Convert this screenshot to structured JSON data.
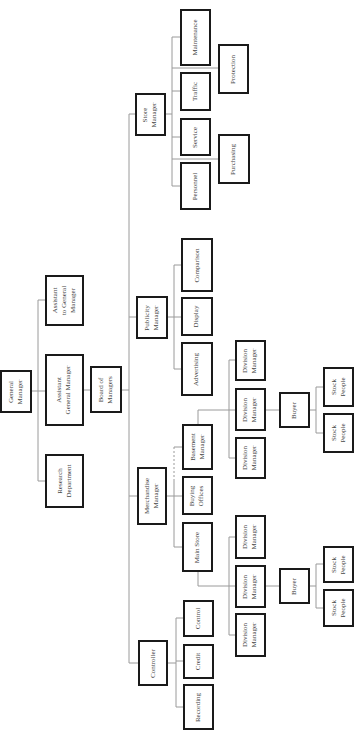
{
  "diagram": {
    "type": "organization-chart",
    "orientation": "rotated-90-ccw",
    "colors": {
      "box_border": "#1a1a1a",
      "connector": "#9a9a9a",
      "text": "#444444",
      "background": "#ffffff"
    },
    "nodes": [
      {
        "id": "gm",
        "label": "General\nManager",
        "x": 0,
        "y": 370,
        "w": 32,
        "h": 43
      },
      {
        "id": "asst_to_gm",
        "label": "Assistant\nto General\nManager",
        "x": 45,
        "y": 275,
        "w": 39,
        "h": 51
      },
      {
        "id": "asst_gm",
        "label": "Assistant\nGeneral Manager",
        "x": 45,
        "y": 354,
        "w": 39,
        "h": 72
      },
      {
        "id": "research",
        "label": "Research\nDepartment",
        "x": 45,
        "y": 454,
        "w": 39,
        "h": 54
      },
      {
        "id": "board",
        "label": "Board of\nManagers",
        "x": 90,
        "y": 366,
        "w": 32,
        "h": 47
      },
      {
        "id": "store_mgr",
        "label": "Store\nManager",
        "x": 135,
        "y": 93,
        "w": 31,
        "h": 43
      },
      {
        "id": "maintenance",
        "label": "Maintenance",
        "x": 180,
        "y": 9,
        "w": 31,
        "h": 57
      },
      {
        "id": "traffic",
        "label": "Traffic",
        "x": 180,
        "y": 72,
        "w": 31,
        "h": 39
      },
      {
        "id": "service",
        "label": "Service",
        "x": 180,
        "y": 118,
        "w": 31,
        "h": 38
      },
      {
        "id": "personnel",
        "label": "Personnel",
        "x": 180,
        "y": 162,
        "w": 31,
        "h": 48
      },
      {
        "id": "protection",
        "label": "Protection",
        "x": 218,
        "y": 44,
        "w": 31,
        "h": 50
      },
      {
        "id": "purchasing",
        "label": "Purchasing",
        "x": 218,
        "y": 134,
        "w": 32,
        "h": 50
      },
      {
        "id": "publicity_mgr",
        "label": "Publicity\nManager",
        "x": 136,
        "y": 296,
        "w": 32,
        "h": 43
      },
      {
        "id": "comparison",
        "label": "Comparison",
        "x": 181,
        "y": 238,
        "w": 32,
        "h": 54
      },
      {
        "id": "display",
        "label": "Display",
        "x": 181,
        "y": 297,
        "w": 32,
        "h": 39
      },
      {
        "id": "advertising",
        "label": "Advertising",
        "x": 181,
        "y": 342,
        "w": 32,
        "h": 54
      },
      {
        "id": "merch_mgr",
        "label": "Merchandise\nManager",
        "x": 137,
        "y": 467,
        "w": 30,
        "h": 58
      },
      {
        "id": "basement_mgr",
        "label": "Basement\nManager",
        "x": 182,
        "y": 424,
        "w": 31,
        "h": 46
      },
      {
        "id": "buying_offices",
        "label": "Buying\nOffices",
        "x": 182,
        "y": 476,
        "w": 31,
        "h": 39
      },
      {
        "id": "main_store",
        "label": "Main Store",
        "x": 182,
        "y": 522,
        "w": 31,
        "h": 50
      },
      {
        "id": "b_div1",
        "label": "Division\nManager",
        "x": 235,
        "y": 340,
        "w": 31,
        "h": 41
      },
      {
        "id": "b_div2",
        "label": "Division\nManager",
        "x": 235,
        "y": 388,
        "w": 31,
        "h": 43
      },
      {
        "id": "b_div3",
        "label": "Division\nManager",
        "x": 235,
        "y": 437,
        "w": 31,
        "h": 42
      },
      {
        "id": "b_buyer",
        "label": "Buyer",
        "x": 279,
        "y": 392,
        "w": 31,
        "h": 36
      },
      {
        "id": "b_stock1",
        "label": "Stock\nPeople",
        "x": 323,
        "y": 367,
        "w": 31,
        "h": 40
      },
      {
        "id": "b_stock2",
        "label": "Stock\nPeople",
        "x": 323,
        "y": 413,
        "w": 31,
        "h": 40
      },
      {
        "id": "m_div1",
        "label": "Division\nManager",
        "x": 235,
        "y": 515,
        "w": 31,
        "h": 44
      },
      {
        "id": "m_div2",
        "label": "Division\nManager",
        "x": 235,
        "y": 565,
        "w": 31,
        "h": 43
      },
      {
        "id": "m_div3",
        "label": "Division\nManager",
        "x": 235,
        "y": 613,
        "w": 31,
        "h": 44
      },
      {
        "id": "m_buyer",
        "label": "Buyer",
        "x": 279,
        "y": 568,
        "w": 31,
        "h": 36
      },
      {
        "id": "m_stock1",
        "label": "Stock\nPeople",
        "x": 323,
        "y": 546,
        "w": 31,
        "h": 37
      },
      {
        "id": "m_stock2",
        "label": "Stock\nPeople",
        "x": 323,
        "y": 589,
        "w": 31,
        "h": 38
      },
      {
        "id": "controller",
        "label": "Controller",
        "x": 138,
        "y": 640,
        "w": 30,
        "h": 46
      },
      {
        "id": "control",
        "label": "Control",
        "x": 183,
        "y": 600,
        "w": 31,
        "h": 37
      },
      {
        "id": "credit",
        "label": "Credit",
        "x": 183,
        "y": 644,
        "w": 31,
        "h": 35
      },
      {
        "id": "recording",
        "label": "Recording",
        "x": 183,
        "y": 684,
        "w": 31,
        "h": 46
      }
    ],
    "edges": [
      [
        "gm",
        "asst_to_gm"
      ],
      [
        "gm",
        "asst_gm"
      ],
      [
        "gm",
        "research"
      ],
      [
        "asst_gm",
        "board"
      ],
      [
        "board",
        "store_mgr"
      ],
      [
        "board",
        "publicity_mgr"
      ],
      [
        "board",
        "merch_mgr"
      ],
      [
        "board",
        "controller"
      ],
      [
        "store_mgr",
        "maintenance"
      ],
      [
        "store_mgr",
        "traffic"
      ],
      [
        "store_mgr",
        "service"
      ],
      [
        "store_mgr",
        "personnel"
      ],
      [
        "store_mgr",
        "protection"
      ],
      [
        "store_mgr",
        "purchasing"
      ],
      [
        "publicity_mgr",
        "comparison"
      ],
      [
        "publicity_mgr",
        "display"
      ],
      [
        "publicity_mgr",
        "advertising"
      ],
      [
        "merch_mgr",
        "basement_mgr"
      ],
      [
        "merch_mgr",
        "buying_offices"
      ],
      [
        "merch_mgr",
        "main_store"
      ],
      [
        "basement_mgr",
        "b_div1"
      ],
      [
        "basement_mgr",
        "b_div2"
      ],
      [
        "basement_mgr",
        "b_div3"
      ],
      [
        "b_div2",
        "b_buyer"
      ],
      [
        "b_buyer",
        "b_stock1"
      ],
      [
        "b_buyer",
        "b_stock2"
      ],
      [
        "main_store",
        "m_div1"
      ],
      [
        "main_store",
        "m_div2"
      ],
      [
        "main_store",
        "m_div3"
      ],
      [
        "m_div2",
        "m_buyer"
      ],
      [
        "m_buyer",
        "m_stock1"
      ],
      [
        "m_buyer",
        "m_stock2"
      ],
      [
        "controller",
        "control"
      ],
      [
        "controller",
        "credit"
      ],
      [
        "controller",
        "recording"
      ]
    ]
  }
}
